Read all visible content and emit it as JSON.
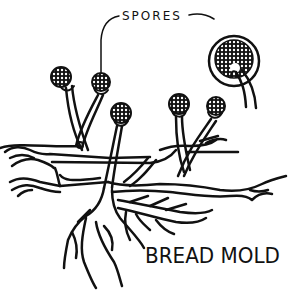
{
  "figure": {
    "title": "BREAD MOLD",
    "labels": {
      "spores": "SPORES"
    },
    "style": {
      "ink_color": "#111111",
      "background": "#ffffff"
    },
    "parts": [
      {
        "name": "sporangium",
        "count": 5
      },
      {
        "name": "sporangiophore",
        "count": 5
      },
      {
        "name": "stolon"
      },
      {
        "name": "rhizoids"
      },
      {
        "name": "enlarged-sporangium-with-spores"
      }
    ]
  }
}
